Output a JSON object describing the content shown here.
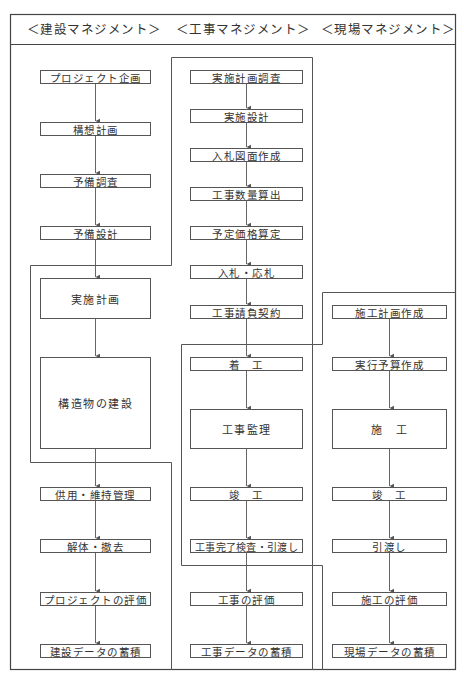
{
  "headers": [
    {
      "label": "＜建設マネジメント＞"
    },
    {
      "label": "＜工事マネジメント＞"
    },
    {
      "label": "＜現場マネジメント＞"
    }
  ],
  "columns": {
    "construction": {
      "steps": [
        {
          "label": "プロジェクト企画"
        },
        {
          "label": "構想計画"
        },
        {
          "label": "予備調査"
        },
        {
          "label": "予備設計"
        },
        {
          "label": "実施計画"
        },
        {
          "label": "構造物の建設"
        },
        {
          "label": "供用・維持管理"
        },
        {
          "label": "解体・撤去"
        },
        {
          "label": "プロジェクトの評価"
        },
        {
          "label": "建設データの蓄積"
        }
      ]
    },
    "works": {
      "steps": [
        {
          "label": "実施計画調査"
        },
        {
          "label": "実施設計"
        },
        {
          "label": "入札図面作成"
        },
        {
          "label": "工事数量算出"
        },
        {
          "label": "予定価格算定"
        },
        {
          "label": "入札・応札"
        },
        {
          "label": "工事請負契約"
        },
        {
          "label": "着　工"
        },
        {
          "label": "工事監理"
        },
        {
          "label": "竣　工"
        },
        {
          "label": "工事完了検査・引渡し"
        },
        {
          "label": "工事の評価"
        },
        {
          "label": "工事データの蓄積"
        }
      ]
    },
    "site": {
      "steps": [
        {
          "label": "施工計画作成"
        },
        {
          "label": "実行予算作成"
        },
        {
          "label": "施　工"
        },
        {
          "label": "竣　工"
        },
        {
          "label": "引渡し"
        },
        {
          "label": "施工の評価"
        },
        {
          "label": "現場データの蓄積"
        }
      ]
    }
  },
  "colors": {
    "line": "#555555",
    "text": "#333333",
    "background": "#ffffff"
  }
}
